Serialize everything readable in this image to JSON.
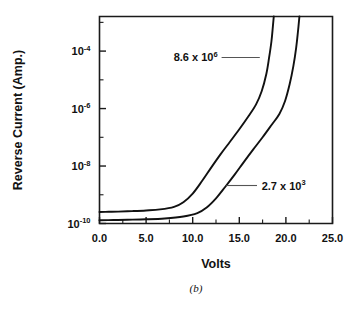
{
  "figure": {
    "caption": "(b)",
    "background": "#ffffff",
    "line_color": "#111111"
  },
  "chart_data": {
    "type": "line",
    "title": "",
    "xlabel": "Volts",
    "ylabel": "Reverse Current (Amp.)",
    "xlim": [
      0,
      25
    ],
    "ylim": [
      1e-10,
      0.0016
    ],
    "yscale": "log",
    "xscale": "linear",
    "grid": false,
    "legend_position": "inline-annotations",
    "xticks": [
      0,
      5,
      10,
      15,
      20,
      25
    ],
    "xticklabels": [
      "0.0",
      "5.0",
      "10.0",
      "15.0",
      "20.0",
      "25.0"
    ],
    "xminor_step": 2.5,
    "yticks": [
      1e-10,
      1e-08,
      1e-06,
      0.0001
    ],
    "yticklabels": [
      "10-10",
      "10-8",
      "10-6",
      "10-4"
    ],
    "ytick_mantissa": [
      "10",
      "10",
      "10",
      "10"
    ],
    "ytick_exponent": [
      "-10",
      "-8",
      "-6",
      "-4"
    ],
    "yminor_decades": [
      1e-09,
      1e-07,
      1e-05
    ],
    "series": [
      {
        "name": "8.6 x 10^6",
        "label_mantissa": "8.6 x 10",
        "label_exponent": "6",
        "x": [
          0.0,
          1.0,
          2.0,
          3.5,
          5.0,
          6.5,
          8.0,
          9.0,
          10.0,
          11.0,
          12.0,
          13.0,
          14.0,
          15.0,
          16.0,
          16.8,
          17.4,
          17.9,
          18.2,
          18.45,
          18.6,
          18.7
        ],
        "y": [
          2.5e-10,
          2.55e-10,
          2.6e-10,
          2.7e-10,
          2.85e-10,
          3.1e-10,
          3.8e-10,
          5.5e-10,
          1.1e-09,
          3e-09,
          9e-09,
          2.6e-08,
          7e-08,
          1.9e-07,
          5.5e-07,
          1.4e-06,
          4e-06,
          1.6e-05,
          6e-05,
          0.00022,
          0.0007,
          0.0016
        ]
      },
      {
        "name": "2.7 x 10^3",
        "label_mantissa": "2.7 x 10",
        "label_exponent": "3",
        "x": [
          0.0,
          1.5,
          3.0,
          5.0,
          7.0,
          9.0,
          10.5,
          11.5,
          12.5,
          13.5,
          14.5,
          15.5,
          16.5,
          17.5,
          18.5,
          19.3,
          19.9,
          20.4,
          20.8,
          21.1,
          21.3,
          21.45
        ],
        "y": [
          1.3e-10,
          1.32e-10,
          1.35e-10,
          1.4e-10,
          1.5e-10,
          1.75e-10,
          2.3e-10,
          3.6e-10,
          7.5e-10,
          1.9e-09,
          5e-09,
          1.4e-08,
          3.8e-08,
          1e-07,
          2.8e-07,
          6.5e-07,
          1.8e-06,
          7e-06,
          3e-05,
          0.00013,
          0.0005,
          0.0016
        ]
      }
    ],
    "annotations": [
      {
        "text": "8.6 x 10^6",
        "mantissa": "8.6 x 10",
        "exponent": "6",
        "text_x": 5.3,
        "text_y": 6e-05,
        "leader_from_x": 13.1,
        "leader_to_x": 17.2,
        "leader_y": 6e-05
      },
      {
        "text": "2.7 x 10^3",
        "mantissa": "2.7 x 10",
        "exponent": "3",
        "text_x": 17.4,
        "text_y": 2.1e-09,
        "leader_from_x": 13.6,
        "leader_to_x": 16.9,
        "leader_y": 2.1e-09
      }
    ]
  }
}
